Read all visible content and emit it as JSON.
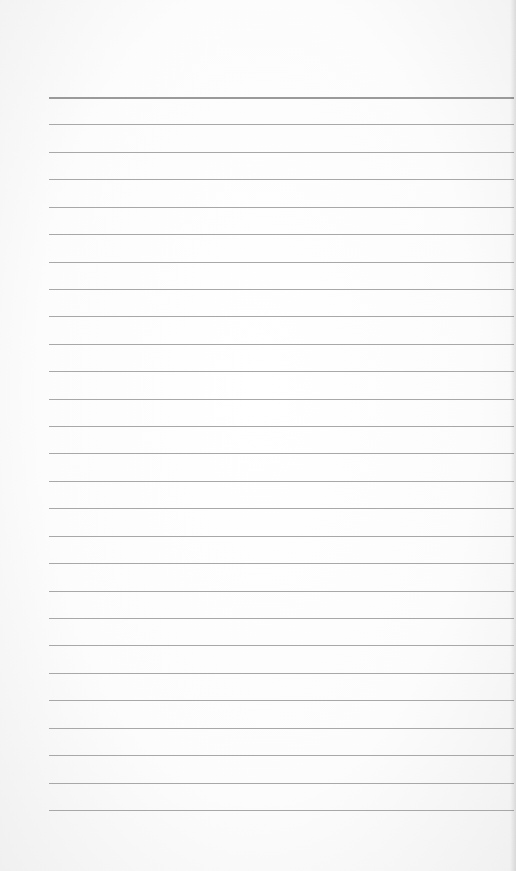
{
  "paper": {
    "type": "lined-notebook-page",
    "rule_count": 27,
    "first_rule_y": 97,
    "rule_spacing": 27.42,
    "rule_left_x": 49,
    "rule_right_x": 514,
    "colors": {
      "background": "#fdfdfd",
      "rule": "#a8a8a8",
      "top_rule": "#9a9a9a"
    }
  }
}
